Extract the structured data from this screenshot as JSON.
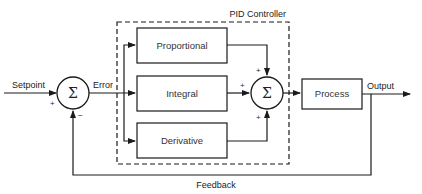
{
  "diagram": {
    "title": "PID Controller",
    "blocks": {
      "proportional": "Proportional",
      "integral": "Integral",
      "derivative": "Derivative",
      "process": "Process"
    },
    "signals": {
      "setpoint": "Setpoint",
      "error": "Error",
      "output": "Output",
      "feedback": "Feedback"
    },
    "summing_junctions": {
      "symbol": "Σ",
      "input_sum": {
        "setpoint_sign": "+",
        "feedback_sign": "−"
      },
      "controller_sum": {
        "proportional_sign": "+",
        "integral_sign": "+",
        "derivative_sign": "+"
      }
    },
    "colors": {
      "stroke": "#1a1a1a",
      "text": "#222222",
      "background": "#ffffff"
    }
  }
}
